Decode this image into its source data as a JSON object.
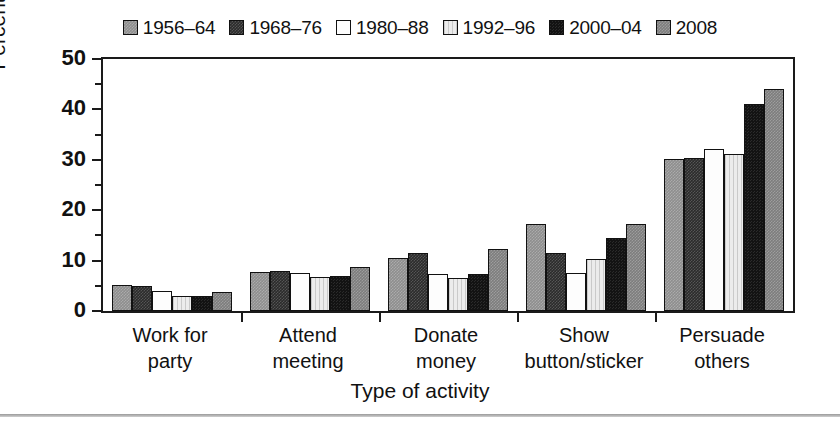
{
  "chart_data": {
    "type": "bar",
    "title": "",
    "xlabel": "Type of activity",
    "ylabel": "Percentage",
    "ylim": [
      0,
      50
    ],
    "yticks": [
      0,
      10,
      20,
      30,
      40,
      50
    ],
    "yminorticks": [
      5,
      15,
      25,
      35,
      45
    ],
    "grid": false,
    "legend_position": "top-center",
    "categories": [
      "Work for\nparty",
      "Attend\nmeeting",
      "Donate\nmoney",
      "Show\nbutton/sticker",
      "Persuade\nothers"
    ],
    "series": [
      {
        "name": "1956–64",
        "color": "#8e8e8e",
        "values": [
          5.1,
          7.8,
          10.6,
          17.3,
          30.1
        ]
      },
      {
        "name": "1968–76",
        "color": "#2b2b2b",
        "values": [
          5.0,
          7.9,
          11.6,
          11.5,
          30.4
        ]
      },
      {
        "name": "1980–88",
        "color": "#fdfdfd",
        "values": [
          3.9,
          7.6,
          7.4,
          7.5,
          32.2
        ]
      },
      {
        "name": "1992–96",
        "color": "#ececec",
        "values": [
          3.0,
          6.7,
          6.6,
          10.3,
          31.2
        ]
      },
      {
        "name": "2000–04",
        "color": "#131313",
        "values": [
          2.9,
          6.9,
          7.4,
          14.4,
          41.1
        ]
      },
      {
        "name": "2008",
        "color": "#7d7d7d",
        "values": [
          3.8,
          8.7,
          12.4,
          17.2,
          44.0
        ]
      }
    ]
  },
  "axes": {
    "y_title": "Percentage",
    "x_title": "Type of activity",
    "y_tick_labels": [
      "50",
      "40",
      "30",
      "20",
      "10",
      "0"
    ]
  },
  "legend": {
    "items": [
      {
        "label": "1956–64"
      },
      {
        "label": "1968–76"
      },
      {
        "label": "1980–88"
      },
      {
        "label": "1992–96"
      },
      {
        "label": "2000–04"
      },
      {
        "label": "2008"
      }
    ]
  }
}
